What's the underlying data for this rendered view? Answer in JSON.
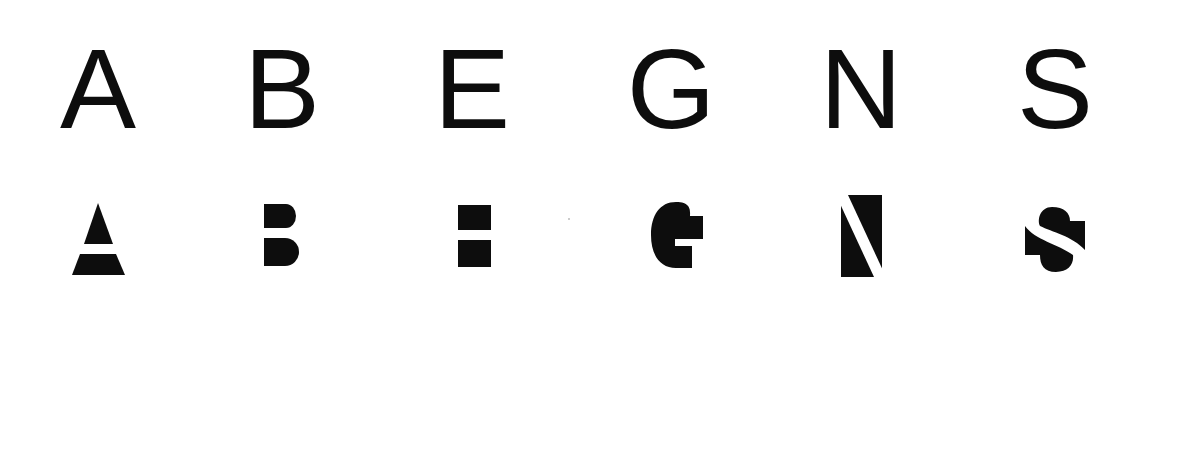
{
  "colors": {
    "ink": "#0d0d0d",
    "background": "#ffffff"
  },
  "top_row": {
    "letters": [
      {
        "char": "A",
        "center_x": 98
      },
      {
        "char": "B",
        "center_x": 282
      },
      {
        "char": "E",
        "center_x": 472
      },
      {
        "char": "G",
        "center_x": 671
      },
      {
        "char": "N",
        "center_x": 861
      },
      {
        "char": "S",
        "center_x": 1055
      }
    ]
  },
  "bottom_row": {
    "abstract_glyphs": [
      {
        "letter": "A",
        "name": "triangle-over-trapezoid"
      },
      {
        "letter": "B",
        "name": "two-rounded-blocks"
      },
      {
        "letter": "E",
        "name": "two-squares"
      },
      {
        "letter": "G",
        "name": "notched-round-block"
      },
      {
        "letter": "N",
        "name": "rectangle-with-diagonal-cut"
      },
      {
        "letter": "S",
        "name": "split-s-blocks"
      }
    ]
  }
}
